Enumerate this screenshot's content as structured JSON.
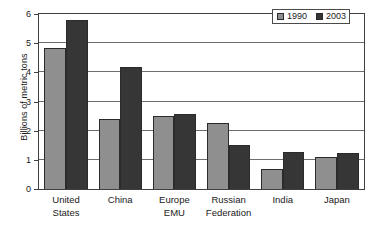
{
  "chart_data": {
    "type": "bar",
    "title": "",
    "xlabel": "",
    "ylabel": "Billions of metric tons",
    "ylim": [
      0,
      6
    ],
    "yticks": [
      0,
      1,
      2,
      3,
      4,
      5,
      6
    ],
    "ytick_labels": [
      "0",
      "1",
      "2",
      "3",
      "4",
      "5",
      "6"
    ],
    "grid": true,
    "legend_position": "top-right",
    "categories": [
      "United States",
      "China",
      "Europe EMU",
      "Russian Federation",
      "India",
      "Japan"
    ],
    "category_lines": [
      [
        "United",
        "States"
      ],
      [
        "China",
        ""
      ],
      [
        "Europe",
        "EMU"
      ],
      [
        "Russian",
        "Federation"
      ],
      [
        "India",
        ""
      ],
      [
        "Japan",
        ""
      ]
    ],
    "series": [
      {
        "name": "1990",
        "color": "#8f8f8f",
        "values": [
          4.85,
          2.4,
          2.5,
          2.28,
          0.7,
          1.1
        ]
      },
      {
        "name": "2003",
        "color": "#363636",
        "values": [
          5.8,
          4.17,
          2.57,
          1.5,
          1.27,
          1.23
        ]
      }
    ]
  },
  "legend": {
    "items": [
      {
        "label": "1990",
        "color": "#8f8f8f"
      },
      {
        "label": "2003",
        "color": "#363636"
      }
    ]
  },
  "axes": {
    "y_title": "Billions of metric tons"
  }
}
